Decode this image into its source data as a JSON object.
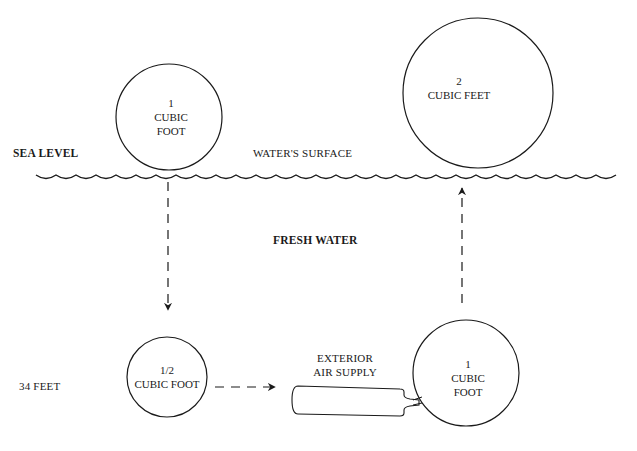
{
  "labels": {
    "sea_level": "SEA LEVEL",
    "waters_surface": "WATER'S SURFACE",
    "fresh_water": "FRESH WATER",
    "depth": "34 FEET",
    "air_supply_line1": "EXTERIOR",
    "air_supply_line2": "AIR SUPPLY"
  },
  "bubbles": [
    {
      "id": "surface-start",
      "line1": "1",
      "line2": "CUBIC",
      "line3": "FOOT"
    },
    {
      "id": "depth-compressed",
      "line1": "1/2",
      "line2": "CUBIC FOOT"
    },
    {
      "id": "depth-refilled",
      "line1": "1",
      "line2": "CUBIC",
      "line3": "FOOT"
    },
    {
      "id": "surface-expanded",
      "line1": "2",
      "line2": "CUBIC FEET"
    }
  ],
  "colors": {
    "ink": "#1a1a1a",
    "background": "#ffffff"
  }
}
